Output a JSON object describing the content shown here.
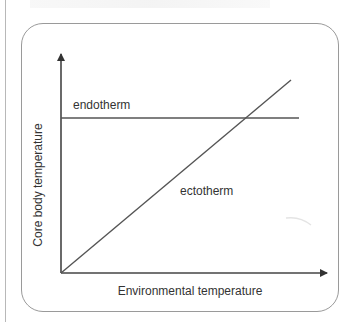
{
  "diagram": {
    "title": "",
    "x_axis_label": "Environmental temperature",
    "y_axis_label": "Core body temperature",
    "series": [
      {
        "name": "endotherm",
        "shape": "horizontal line",
        "label": "endotherm"
      },
      {
        "name": "ectotherm",
        "shape": "diagonal line from origin",
        "label": "ectotherm"
      }
    ],
    "colors": {
      "line": "#555555",
      "axis": "#333333",
      "frame": "#9a9a9a",
      "text": "#333333"
    }
  }
}
